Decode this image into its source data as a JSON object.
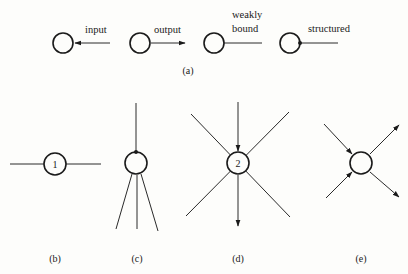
{
  "figure": {
    "part_a": {
      "caption": "(a)",
      "legend": [
        {
          "label": "input",
          "type": "input-arrow"
        },
        {
          "label": "output",
          "type": "output-arrow"
        },
        {
          "label_line1": "weakly",
          "label_line2": "bound",
          "type": "weakly-bound-line"
        },
        {
          "label": "structured",
          "type": "structured-dot-line"
        }
      ]
    },
    "part_b": {
      "caption": "(b)",
      "node_label": "1"
    },
    "part_c": {
      "caption": "(c)"
    },
    "part_d": {
      "caption": "(d)",
      "node_label": "2"
    },
    "part_e": {
      "caption": "(e)"
    }
  },
  "colors": {
    "ink": "#1a1a1a",
    "background": "#fdfdfb"
  }
}
